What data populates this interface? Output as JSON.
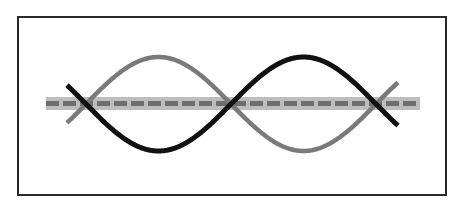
{
  "diagram": {
    "type": "standing-wave",
    "frame": {
      "x": 17,
      "y": 16,
      "width": 430,
      "height": 180,
      "stroke": "#2a2a2a"
    },
    "axis_line": {
      "style": "dashed-on-band",
      "y": 104,
      "x_start": 46,
      "x_end": 420,
      "band_color": "#b9b9b9",
      "dash_color": "#6e6e6e"
    },
    "waves": [
      {
        "name": "wave-grey",
        "color": "#7a7a7a",
        "phase": "positive-first",
        "x_start": 67,
        "x_end": 398,
        "amplitude": 47
      },
      {
        "name": "wave-black",
        "color": "#111111",
        "phase": "negative-first",
        "x_start": 67,
        "x_end": 398,
        "amplitude": 47
      }
    ],
    "nodes_x": [
      86,
      231,
      375
    ],
    "center_y": 104,
    "half_period": 145
  }
}
